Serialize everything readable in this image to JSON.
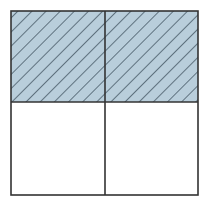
{
  "diagram": {
    "type": "fraction-grid",
    "rows": 2,
    "cols": 2,
    "shaded_cells": [
      [
        0,
        0
      ],
      [
        0,
        1
      ]
    ],
    "shaded_fraction": "2/4",
    "colors": {
      "fill": "#b9cedb",
      "hatch": "#2e3f4d",
      "border": "#333333",
      "background": "#ffffff"
    },
    "hatch_direction": "diagonal-down-right"
  }
}
